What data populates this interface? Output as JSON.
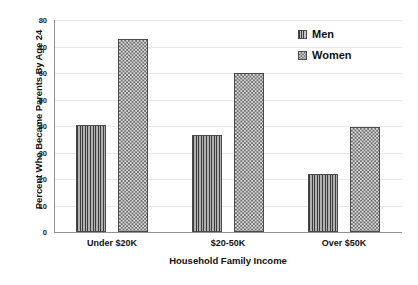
{
  "chart_data": {
    "type": "bar",
    "title": "",
    "xlabel": "Household Family Income",
    "ylabel": "Percent Who Became Parents By Age 24",
    "categories": [
      "Under $20K",
      "$20-50K",
      "Over $50K"
    ],
    "series": [
      {
        "name": "Men",
        "pattern": "vertical-stripes",
        "values": [
          40.5,
          36.5,
          22
        ]
      },
      {
        "name": "Women",
        "pattern": "checkerboard",
        "values": [
          73,
          60,
          39.5
        ]
      }
    ],
    "ylim": [
      0,
      80
    ],
    "ytick_labels": [
      "0",
      "10",
      "20",
      "30",
      "40",
      "50",
      "60",
      "70",
      "80"
    ],
    "ytick_values": [
      0,
      10,
      20,
      30,
      40,
      50,
      60,
      70,
      80
    ],
    "grid": true,
    "legend_position": "top-right",
    "colors": {
      "men_fill": "#7d7d7d",
      "women_fill": "#cfcfcf",
      "bar_outline": "#4a4a4a",
      "gridline": "#e9e9e9",
      "axis": "#8f8f8f",
      "text": "#111111",
      "background": "#ffffff"
    }
  }
}
